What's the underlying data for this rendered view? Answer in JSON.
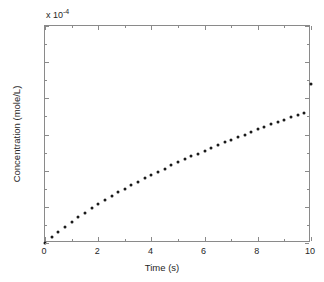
{
  "chart_data": {
    "type": "scatter",
    "title": "",
    "xlabel": "Time (s)",
    "ylabel": "Concentration (mole/L)",
    "y_exponent_label": "x 10",
    "y_exponent_power": "-4",
    "y_scale": 0.0001,
    "xlim": [
      0,
      10
    ],
    "ylim": [
      0,
      3
    ],
    "xticks": [
      0,
      2,
      4,
      6,
      8,
      10
    ],
    "xtick_labels": [
      "0",
      "2",
      "4",
      "6",
      "8",
      "10"
    ],
    "yticks": [
      0,
      0.5,
      1,
      1.5,
      2,
      2.5,
      3
    ],
    "ytick_labels": [
      "0",
      "0.5",
      "1",
      "1.5",
      "2",
      "2.5",
      "3"
    ],
    "x_minor_ticks": [
      1,
      3,
      5,
      7,
      9
    ],
    "y_minor_ticks": [
      0.25,
      0.75,
      1.25,
      1.75,
      2.25,
      2.75
    ],
    "grid": false,
    "legend": null,
    "marker": "dot",
    "marker_color": "#1a1a1a",
    "marker_size_px": 3,
    "axis_color": "#8a8a8a",
    "background": "#ffffff",
    "n_points": 41,
    "x": [
      0,
      0.25,
      0.5,
      0.75,
      1,
      1.25,
      1.5,
      1.75,
      2,
      2.25,
      2.5,
      2.75,
      3,
      3.25,
      3.5,
      3.75,
      4,
      4.25,
      4.5,
      4.75,
      5,
      5.25,
      5.5,
      5.75,
      6,
      6.25,
      6.5,
      6.75,
      7,
      7.25,
      7.5,
      7.75,
      8,
      8.25,
      8.5,
      8.75,
      9,
      9.25,
      9.5,
      9.75,
      10
    ],
    "y": [
      0.0,
      0.079,
      0.154,
      0.225,
      0.293,
      0.358,
      0.42,
      0.48,
      0.537,
      0.593,
      0.647,
      0.699,
      0.75,
      0.799,
      0.847,
      0.894,
      0.94,
      0.985,
      1.029,
      1.072,
      1.114,
      1.156,
      1.197,
      1.237,
      1.276,
      1.315,
      1.353,
      1.391,
      1.428,
      1.464,
      1.5,
      1.536,
      1.571,
      1.605,
      1.639,
      1.673,
      1.706,
      1.739,
      1.772,
      1.804,
      2.195
    ],
    "y_units_note": "values in units of 1e-4 mole/L"
  }
}
